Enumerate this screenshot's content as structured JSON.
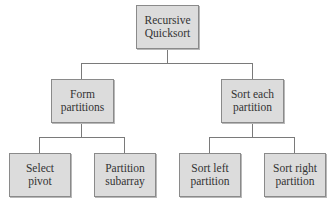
{
  "diagram": {
    "type": "tree",
    "root": {
      "label": "Recursive\nQuicksort",
      "lines": [
        "Recursive",
        "Quicksort"
      ]
    },
    "level1": [
      {
        "lines": [
          "Form",
          "partitions"
        ]
      },
      {
        "lines": [
          "Sort each",
          "partition"
        ]
      }
    ],
    "level2": [
      {
        "parent": 0,
        "lines": [
          "Select",
          "pivot"
        ]
      },
      {
        "parent": 0,
        "lines": [
          "Partition",
          "subarray"
        ]
      },
      {
        "parent": 1,
        "lines": [
          "Sort left",
          "partition"
        ]
      },
      {
        "parent": 1,
        "lines": [
          "Sort right",
          "partition"
        ]
      }
    ],
    "colors": {
      "node_fill": "#dcdcdc",
      "border": "#8a8a8a",
      "line": "#7a7a7a",
      "text": "#333333"
    }
  }
}
